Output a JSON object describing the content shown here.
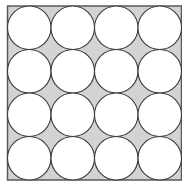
{
  "diagram": {
    "rows": 4,
    "cols": 4,
    "square": {
      "x": 7.5,
      "y": 6,
      "size": 174
    },
    "colors": {
      "square_fill": "#d3d3d3",
      "circle_fill": "#ffffff",
      "stroke": "#3a3a3a",
      "square_stroke": "#5a5a5a"
    }
  }
}
